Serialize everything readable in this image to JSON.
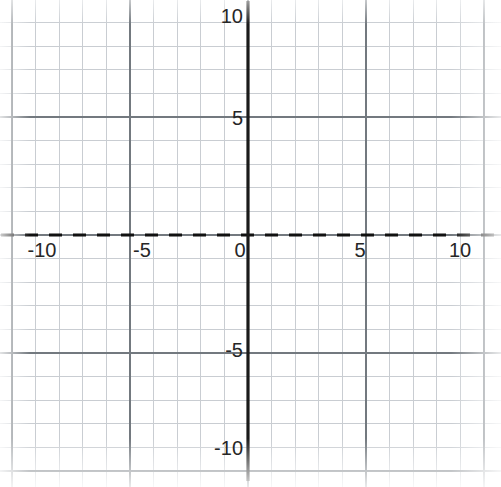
{
  "figure": {
    "kind": "hand-drawn-graph-on-grid-paper",
    "background_color": "#ffffff",
    "minor_grid_color": "#c9cdd2",
    "major_grid_color": "#6e7479",
    "axis_color": "#1a1a1a",
    "curve_color": "#5b9bd1",
    "asymptote_color": "#e8735a",
    "tick_text_color": "#262626"
  },
  "axes": {
    "x_label_values": [
      "-10",
      "-5",
      "0",
      "5",
      "10"
    ],
    "y_label_values": [
      "10",
      "5",
      "-5",
      "-10"
    ],
    "x_axis_name": "",
    "y_axis_name": ""
  },
  "chart_data": {
    "type": "line",
    "title": "",
    "xlabel": "",
    "ylabel": "",
    "xlim": [
      -10.5,
      10.7
    ],
    "ylim": [
      -10.6,
      10.7
    ],
    "xticks": [
      -10,
      -5,
      0,
      5,
      10
    ],
    "yticks": [
      -10,
      -5,
      5,
      10
    ],
    "xtick_labels": [
      "-10",
      "-5",
      "0",
      "5",
      "10"
    ],
    "ytick_labels": [
      "-10",
      "-5",
      "5",
      "10"
    ],
    "grid": true,
    "grid_minor_step": 1,
    "grid_major_step": 5,
    "legend": false,
    "legend_position": "none",
    "annotations": [],
    "series": [
      {
        "name": "exponential-growth-curve",
        "kind": "line",
        "color": "#5b9bd1",
        "linewidth": 4.5,
        "style": "solid",
        "note": "increasing exponential, y-intercept 1, passes (2,5), exits top near x=3.1",
        "x": [
          -10.5,
          -10,
          -9,
          -8,
          -7,
          -6,
          -5,
          -4.5,
          -4,
          -3.5,
          -3,
          -2.5,
          -2,
          -1.5,
          -1,
          -0.5,
          0,
          0.5,
          1,
          1.5,
          2,
          2.25,
          2.5,
          2.75,
          3,
          3.12
        ],
        "y": [
          0.01,
          0.012,
          0.018,
          0.028,
          0.042,
          0.065,
          0.1,
          0.125,
          0.16,
          0.2,
          0.25,
          0.32,
          0.42,
          0.58,
          0.78,
          0.88,
          1.0,
          1.5,
          2.24,
          3.35,
          5.0,
          5.95,
          7.1,
          8.45,
          10.05,
          10.8
        ]
      },
      {
        "name": "horizontal-asymptote",
        "kind": "line",
        "color": "#e8735a",
        "linewidth": 4,
        "style": "solid",
        "note": "y = 0 asymptote drawn in orange over the x-axis",
        "x": [
          -10.5,
          10.7
        ],
        "y": [
          0,
          0
        ]
      }
    ]
  }
}
